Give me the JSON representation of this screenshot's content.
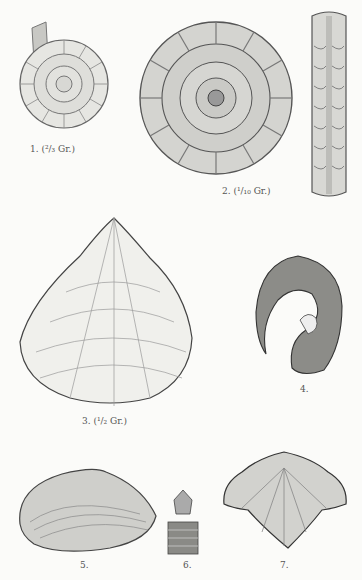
{
  "plate": {
    "figures": [
      {
        "num": "1.",
        "label": "1. (²/₃ Gr.)",
        "subject": "ammonite-small"
      },
      {
        "num": "2.",
        "label": "2. (¹/₁₀ Gr.)",
        "subject": "ammonite-large"
      },
      {
        "num": "2b",
        "label": "",
        "subject": "ammonite-keel-view"
      },
      {
        "num": "3.",
        "label": "3. (¹/₂ Gr.)",
        "subject": "bivalve-large"
      },
      {
        "num": "4.",
        "label": "4.",
        "subject": "coiled-gastropod"
      },
      {
        "num": "5.",
        "label": "5.",
        "subject": "bivalve-small"
      },
      {
        "num": "6.",
        "label": "6.",
        "subject": "crinoid-stem"
      },
      {
        "num": "7.",
        "label": "7.",
        "subject": "brachiopod"
      }
    ]
  }
}
